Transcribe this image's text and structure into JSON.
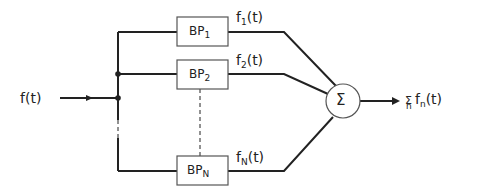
{
  "input": {
    "label": "f(t)"
  },
  "filters": [
    {
      "name": "BP",
      "sub": "1",
      "output": "f",
      "output_sub": "1",
      "output_arg": "(t)"
    },
    {
      "name": "BP",
      "sub": "2",
      "output": "f",
      "output_sub": "2",
      "output_arg": "(t)"
    },
    {
      "name": "BP",
      "sub": "N",
      "output": "f",
      "output_sub": "N",
      "output_arg": "(t)"
    }
  ],
  "summer": {
    "symbol": "Σ"
  },
  "output": {
    "sigma": "Σ",
    "sigma_sub": "n",
    "expr": "f",
    "expr_sub": "n",
    "arg": "(t)"
  },
  "colors": {
    "stroke": "#222222",
    "box": "#555555"
  }
}
